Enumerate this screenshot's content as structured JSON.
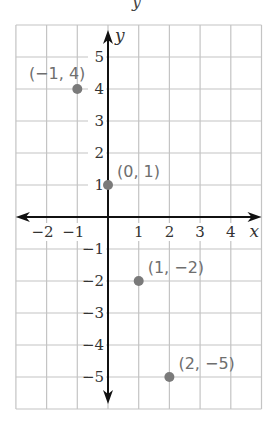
{
  "header_fragment": "y",
  "chart_data": {
    "type": "scatter",
    "title": "",
    "xlabel": "x",
    "ylabel": "y",
    "xlim": [
      -3,
      5
    ],
    "ylim": [
      -6,
      6
    ],
    "grid": true,
    "x_ticks": [
      -2,
      -1,
      1,
      2,
      3,
      4
    ],
    "y_ticks": [
      5,
      4,
      3,
      2,
      1,
      -1,
      -2,
      -3,
      -4,
      -5
    ],
    "points": [
      {
        "x": -1,
        "y": 4,
        "label": "(−1, 4)"
      },
      {
        "x": 0,
        "y": 1,
        "label": "(0, 1)"
      },
      {
        "x": 1,
        "y": -2,
        "label": "(1, −2)"
      },
      {
        "x": 2,
        "y": -5,
        "label": "(2, −5)"
      }
    ],
    "colors": {
      "grid": "#c4c4c4",
      "axis": "#111111",
      "point": "#7a7a7a",
      "point_label": "#6e6e6e"
    }
  }
}
